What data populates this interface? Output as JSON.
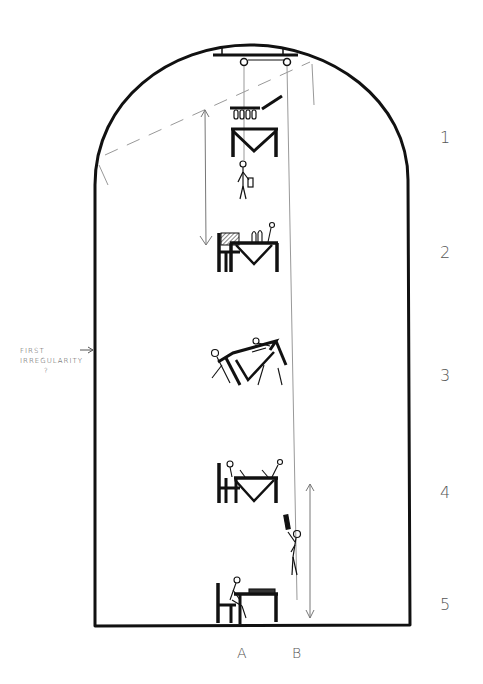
{
  "diagram": {
    "type": "hand-drawn sketch",
    "frame": "arch-shaped enclosure (rounded top, flat bottom)",
    "stages": [
      {
        "label": "1",
        "description": "table suspended upside-down from ceiling rig; glasses hanging; person standing below with bag"
      },
      {
        "label": "2",
        "description": "table lowered; chair with hatched back; bottles on table; figure at right"
      },
      {
        "label": "3",
        "description": "table tilted; figures falling across it"
      },
      {
        "label": "4",
        "description": "table with seated figures; person below holding object aloft"
      },
      {
        "label": "5",
        "description": "single seated figure at small table on floor"
      }
    ],
    "positions": [
      {
        "label": "A"
      },
      {
        "label": "B"
      }
    ],
    "annotation": {
      "line1": "FIRST",
      "line2": "IRREGULARITY",
      "line3": "?",
      "arrow": "→"
    },
    "colors": {
      "ink": "#111111",
      "pencil": "#888888",
      "label": "#555555",
      "background": "#ffffff"
    }
  }
}
